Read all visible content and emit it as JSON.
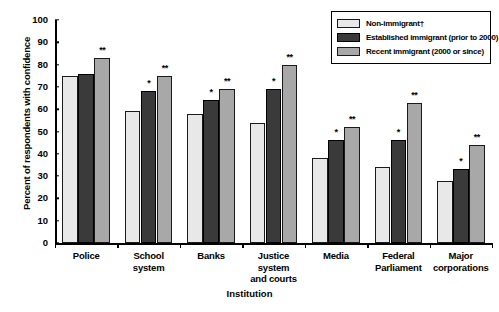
{
  "chart_data": {
    "type": "bar",
    "title": "",
    "xlabel": "Institution",
    "ylabel": "Percent of respondents with confidence",
    "ylim": [
      0,
      100
    ],
    "yticks": [
      0,
      10,
      20,
      30,
      40,
      50,
      60,
      70,
      80,
      90,
      100
    ],
    "grid": false,
    "legend_position": "top-right",
    "categories": [
      "Police",
      "School system",
      "Banks",
      "Justice system and courts",
      "Media",
      "Federal Parliament",
      "Major corporations"
    ],
    "category_lines": [
      [
        "Police"
      ],
      [
        "School system"
      ],
      [
        "Banks"
      ],
      [
        "Justice system",
        "and courts"
      ],
      [
        "Media"
      ],
      [
        "Federal",
        "Parliament"
      ],
      [
        "Major",
        "corporations"
      ]
    ],
    "series": [
      {
        "name": "Non-immigrant†",
        "color": "#e8e8e8",
        "values": [
          75,
          59,
          58,
          54,
          38,
          34,
          28
        ],
        "significance": [
          "",
          "",
          "",
          "",
          "",
          "",
          ""
        ]
      },
      {
        "name": "Established immigrant (prior to 2000)",
        "color": "#3a3a3a",
        "values": [
          76,
          68,
          64,
          69,
          46,
          46,
          33
        ],
        "significance": [
          "",
          "*",
          "*",
          "*",
          "*",
          "*",
          "*"
        ]
      },
      {
        "name": "Recent immigrant (2000 or since)",
        "color": "#a8a8a8",
        "values": [
          83,
          75,
          69,
          80,
          52,
          63,
          44
        ],
        "significance": [
          "**",
          "**",
          "**",
          "**",
          "**",
          "**",
          "**"
        ]
      }
    ]
  }
}
